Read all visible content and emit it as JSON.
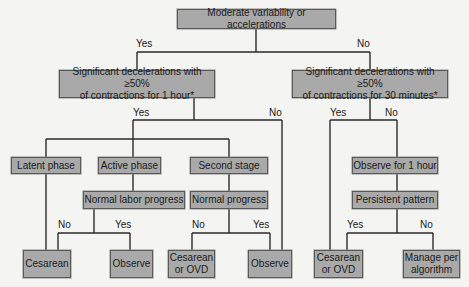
{
  "diagram": {
    "nodes": {
      "root": "Moderate variability or accelerations",
      "decel_1h": "Significant decelerations with ≥50%\nof contractions for 1 hour*",
      "decel_30m": "Significant decelerations with ≥50%\nof contractions for 30 minutes*",
      "latent": "Latent phase",
      "active": "Active phase",
      "second": "Second stage",
      "normal_labor": "Normal labor progress",
      "normal_prog": "Normal progress",
      "observe_1h": "Observe for 1 hour",
      "persistent": "Persistent pattern",
      "cesarean_1": "Cesarean",
      "observe_1": "Observe",
      "cesarean_ovd_1": "Cesarean\nor OVD",
      "observe_2": "Observe",
      "cesarean_ovd_2": "Cesarean\nor OVD",
      "manage": "Manage per\nalgorithm"
    },
    "edges": {
      "root_yes": "Yes",
      "root_no": "No",
      "d1_yes": "Yes",
      "d1_no": "No",
      "d2_yes": "Yes",
      "d2_no": "No",
      "nlp_no": "No",
      "nlp_yes": "Yes",
      "np_no": "No",
      "np_yes": "Yes",
      "pp_yes": "Yes",
      "pp_no": "No"
    }
  }
}
